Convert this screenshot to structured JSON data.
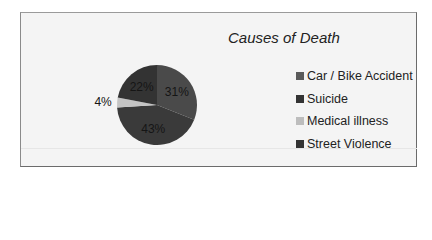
{
  "chart_data": {
    "type": "pie",
    "title": "Causes of Death",
    "categories": [
      "Car / Bike Accident",
      "Suicide",
      "Medical illness",
      "Street Violence"
    ],
    "values": [
      31,
      43,
      4,
      22
    ],
    "labels": [
      "31%",
      "43%",
      "4%",
      "22%"
    ],
    "colors": [
      "#4a4a4a",
      "#3a3a3a",
      "#c4c4c4",
      "#333333"
    ],
    "legend_position": "right"
  },
  "title": "Causes of Death",
  "legend": [
    {
      "label": "Car / Bike Accident",
      "color": "#5a5a5a"
    },
    {
      "label": "Suicide",
      "color": "#333333"
    },
    {
      "label": "Medical illness",
      "color": "#bdbdbd"
    },
    {
      "label": "Street Violence",
      "color": "#333333"
    }
  ]
}
